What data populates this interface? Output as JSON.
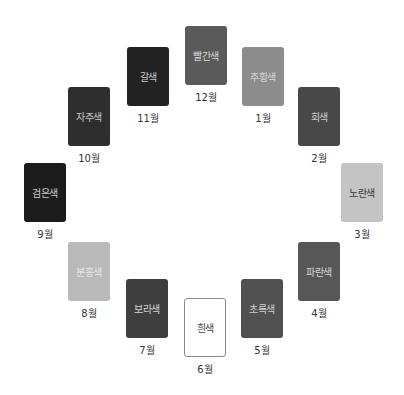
{
  "cards": [
    {
      "month": "12월",
      "label": "빨간색",
      "bg": "#5a5a5a",
      "fg": "#d8d8d8"
    },
    {
      "month": "1월",
      "label": "주황색",
      "bg": "#8c8c8c",
      "fg": "#d6d6d6"
    },
    {
      "month": "2월",
      "label": "회색",
      "bg": "#484848",
      "fg": "#d0d0d0"
    },
    {
      "month": "3월",
      "label": "노란색",
      "bg": "#c4c4c4",
      "fg": "#3a3a3a"
    },
    {
      "month": "4월",
      "label": "파란색",
      "bg": "#575757",
      "fg": "#d6d6d6"
    },
    {
      "month": "5월",
      "label": "초록색",
      "bg": "#505050",
      "fg": "#cfcfcf"
    },
    {
      "month": "6월",
      "label": "흰색",
      "bg": "#ffffff",
      "fg": "#444444"
    },
    {
      "month": "7월",
      "label": "보라색",
      "bg": "#3e3e3e",
      "fg": "#d4d4d4"
    },
    {
      "month": "8월",
      "label": "분홍색",
      "bg": "#b9b9b9",
      "fg": "#e6e6e6"
    },
    {
      "month": "9월",
      "label": "검은색",
      "bg": "#1c1c1c",
      "fg": "#cccccc"
    },
    {
      "month": "10월",
      "label": "자주색",
      "bg": "#2e2e2e",
      "fg": "#c8c8c8"
    },
    {
      "month": "11월",
      "label": "갈색",
      "bg": "#222222",
      "fg": "#cacaca"
    }
  ]
}
